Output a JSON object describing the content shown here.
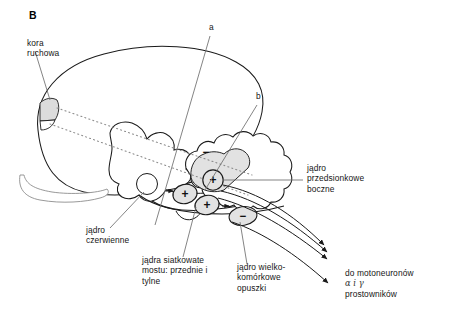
{
  "figure": {
    "panel_letter": "B",
    "type": "anatomical-diagram",
    "language": "pl",
    "background_color": "#ffffff",
    "line_color": "#1a1a1a",
    "shade_color": "#e2e2e2",
    "dotted_color": "#8a8a8a"
  },
  "labels": {
    "motor_cortex": "kora\nruchowa",
    "red_nucleus": "jądro\nczerwienne",
    "pontine_reticular": "jądra siatkowate\nmostu: przednie i\ntylne",
    "magnocellular_medulla": "jądro wielko-\nkomórkowe\nopuszki",
    "lateral_vestibular": "jądro\nprzedsionkowe\nboczne",
    "motoneuron_target_line1": "do motoneuronów",
    "motoneuron_target_line2": "α i γ",
    "motoneuron_target_line3": "prostowników",
    "pointer_a": "a",
    "pointer_b": "b"
  },
  "signs": {
    "cerebellar_vermis": "−",
    "vestibular_nucleus": "+",
    "pontine_anterior": "+",
    "pontine_posterior": "+",
    "medullary_reticular": "−"
  },
  "structures": [
    {
      "name": "cerebral-cortex-outline",
      "shaded": false
    },
    {
      "name": "motor-cortex-region",
      "shaded": true,
      "sign": null
    },
    {
      "name": "cerebellum",
      "shaded": false
    },
    {
      "name": "cerebellar-vermis-shaded",
      "shaded": true,
      "sign": "−"
    },
    {
      "name": "brainstem",
      "shaded": false
    },
    {
      "name": "red-nucleus",
      "shaded": false,
      "sign": null
    },
    {
      "name": "lateral-vestibular-nucleus",
      "shaded": true,
      "sign": "+"
    },
    {
      "name": "pontine-reticular-nucleus-anterior",
      "shaded": true,
      "sign": "+"
    },
    {
      "name": "pontine-reticular-nucleus-posterior",
      "shaded": true,
      "sign": "+"
    },
    {
      "name": "magnocellular-medullary-nucleus",
      "shaded": true,
      "sign": "−"
    }
  ],
  "tracts": {
    "descending_count": 4,
    "arrowhead_count": 4,
    "direction": "down-right",
    "target": "do motoneuronów α i γ prostowników"
  }
}
